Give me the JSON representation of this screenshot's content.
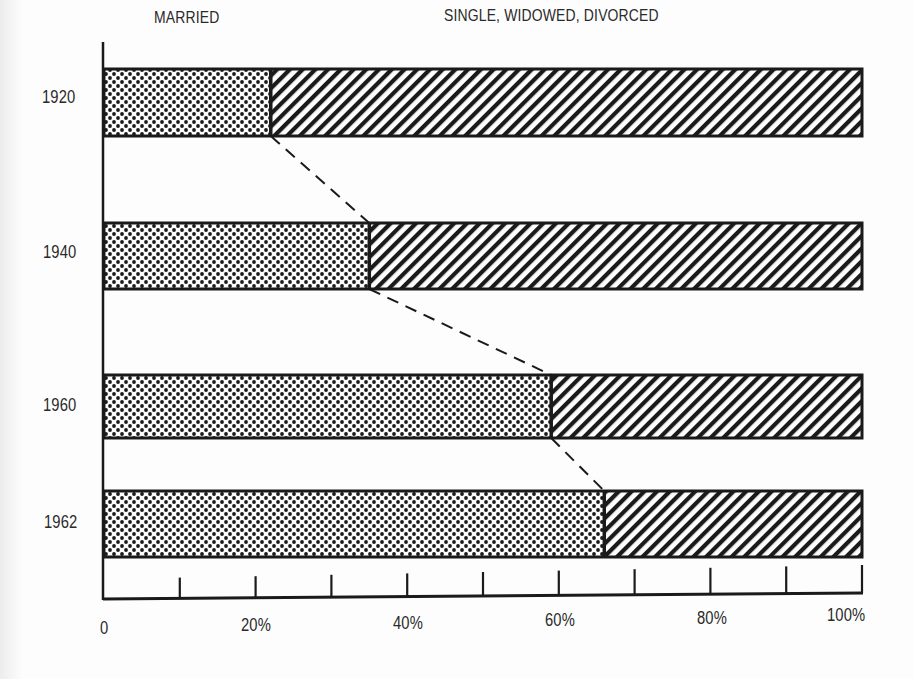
{
  "chart_data": {
    "type": "bar",
    "orientation": "horizontal",
    "stacked": true,
    "percent_stacked": true,
    "title": "",
    "categories": [
      "1920",
      "1940",
      "1960",
      "1962"
    ],
    "series": [
      {
        "name": "MARRIED",
        "pattern": "dots",
        "values": [
          22,
          35,
          59,
          66
        ]
      },
      {
        "name": "SINGLE, WIDOWED, DIVORCED",
        "pattern": "diagonal-hatch",
        "values": [
          78,
          65,
          41,
          34
        ]
      }
    ],
    "connector": "dashed line linking the MARRIED/other boundary between consecutive years",
    "xlabel": "",
    "ylabel": "",
    "xlim": [
      0,
      100
    ],
    "x_ticks": [
      "0",
      "20%",
      "40%",
      "60%",
      "80%",
      "100%"
    ],
    "minor_tick_step": 10,
    "legend_position": "top, labels above each segment",
    "grid": false
  },
  "legend": {
    "married": "MARRIED",
    "other": "SINGLE, WIDOWED, DIVORCED"
  },
  "years": [
    "1920",
    "1940",
    "1960",
    "1962"
  ],
  "axis": {
    "ticks": [
      "0",
      "20%",
      "40%",
      "60%",
      "80%",
      "100%"
    ]
  },
  "colors": {
    "ink": "#1a1a1a",
    "paper": "#fdfdfd"
  }
}
